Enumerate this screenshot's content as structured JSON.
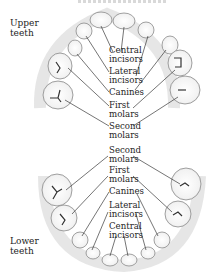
{
  "diagram": {
    "type": "anatomical-labeled-illustration",
    "title_visible": false,
    "jaws": {
      "upper": {
        "label": "Upper\nteeth",
        "line1": "Upper",
        "line2": "teeth"
      },
      "lower": {
        "label": "Lower\nteeth",
        "line1": "Lower",
        "line2": "teeth"
      }
    },
    "upper_labels": [
      {
        "l1": "Central",
        "l2": "incisors"
      },
      {
        "l1": "Lateral",
        "l2": "incisors"
      },
      {
        "l1": "Canines",
        "l2": ""
      },
      {
        "l1": "First",
        "l2": "molars"
      },
      {
        "l1": "Second",
        "l2": "molars"
      }
    ],
    "lower_labels": [
      {
        "l1": "Second",
        "l2": "molars"
      },
      {
        "l1": "First",
        "l2": "molars"
      },
      {
        "l1": "Canines",
        "l2": ""
      },
      {
        "l1": "Lateral",
        "l2": "incisors"
      },
      {
        "l1": "Central",
        "l2": "incisors"
      }
    ],
    "colors": {
      "tooth_fill": "#ffffff",
      "tooth_shade": "#9a9a9a",
      "gum_shade": "#d9d9d9",
      "leader_line": "#3a3a3a",
      "text": "#1e1e1e"
    }
  }
}
